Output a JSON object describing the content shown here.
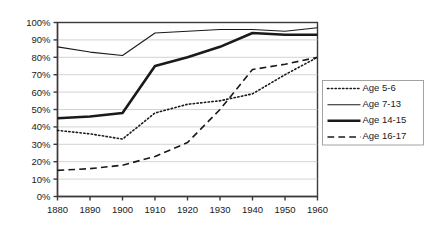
{
  "chart_data": {
    "type": "line",
    "title": "",
    "subtitle": "",
    "xlabel": "",
    "ylabel": "",
    "grid": true,
    "legend_position": "right",
    "x": [
      1880,
      1890,
      1900,
      1910,
      1920,
      1930,
      1940,
      1950,
      1960
    ],
    "xtick_labels": [
      "1880",
      "1890",
      "1900",
      "1910",
      "1920",
      "1930",
      "1940",
      "1950",
      "1960"
    ],
    "ytick_labels": [
      "0%",
      "10%",
      "20%",
      "30%",
      "40%",
      "50%",
      "60%",
      "70%",
      "80%",
      "90%",
      "100%"
    ],
    "ytick_values": [
      0,
      10,
      20,
      30,
      40,
      50,
      60,
      70,
      80,
      90,
      100
    ],
    "ylim": [
      0,
      100
    ],
    "xlim": [
      1880,
      1960
    ],
    "series": [
      {
        "name": "Age 5-6",
        "style": "dotted",
        "color": "#1a1a1a",
        "width": 1.6,
        "values": [
          38,
          36,
          33,
          48,
          53,
          55,
          59,
          70,
          80
        ]
      },
      {
        "name": "Age 7-13",
        "style": "solid",
        "color": "#1a1a1a",
        "width": 1.1,
        "values": [
          86,
          83,
          81,
          94,
          95,
          96,
          96,
          95,
          97
        ]
      },
      {
        "name": "Age 14-15",
        "style": "solid",
        "color": "#1a1a1a",
        "width": 2.6,
        "values": [
          45,
          46,
          48,
          75,
          80,
          86,
          94,
          93,
          93
        ]
      },
      {
        "name": "Age 16-17",
        "style": "dashed",
        "color": "#1a1a1a",
        "width": 1.6,
        "values": [
          15,
          16,
          18,
          23,
          31,
          50,
          73,
          76,
          80
        ]
      }
    ]
  },
  "legend": {
    "entries": [
      {
        "label": "Age 5-6"
      },
      {
        "label": "Age 7-13"
      },
      {
        "label": "Age 14-15"
      },
      {
        "label": "Age 16-17"
      }
    ]
  }
}
